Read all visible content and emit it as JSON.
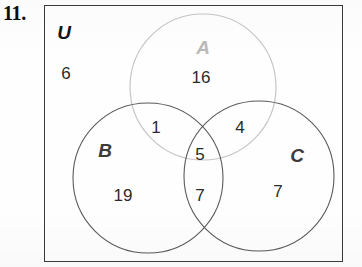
{
  "problem": {
    "number_label": "11."
  },
  "diagram": {
    "type": "venn-3-set",
    "universe_label": "U",
    "sets": [
      {
        "key": "A",
        "label": "A",
        "cx": 203,
        "cy": 87,
        "r": 73,
        "stroke": "#c6c6c6",
        "label_color": "#b9b9b9"
      },
      {
        "key": "B",
        "label": "B",
        "cx": 148,
        "cy": 178,
        "r": 75,
        "stroke": "#5a5a5a",
        "label_color": "#3c3c3c"
      },
      {
        "key": "C",
        "label": "C",
        "cx": 259,
        "cy": 176,
        "r": 75,
        "stroke": "#5a5a5a",
        "label_color": "#3c3c3c"
      }
    ],
    "regions": [
      {
        "key": "outside",
        "region": "U only (outside A, B, C)",
        "value": "6"
      },
      {
        "key": "a_only",
        "region": "A only",
        "value": "16"
      },
      {
        "key": "ab",
        "region": "A and B only",
        "value": "1"
      },
      {
        "key": "ac",
        "region": "A and C only",
        "value": "4"
      },
      {
        "key": "abc",
        "region": "A and B and C",
        "value": "5"
      },
      {
        "key": "bc",
        "region": "B and C only",
        "value": "7"
      },
      {
        "key": "b_only",
        "region": "B only",
        "value": "19"
      },
      {
        "key": "c_only",
        "region": "C only",
        "value": "7"
      }
    ],
    "colors": {
      "rect_border": "#3a3a3a",
      "circle_a_stroke": "#c6c6c6",
      "circle_bc_stroke": "#5a5a5a",
      "number_text": "#2b2b2b",
      "background": "#fefefe"
    }
  },
  "chart_data": {
    "type": "diagram",
    "title": "",
    "categories": [
      "U only",
      "A only",
      "A∩B only",
      "A∩C only",
      "A∩B∩C",
      "B∩C only",
      "B only",
      "C only"
    ],
    "values": [
      6,
      16,
      1,
      4,
      5,
      7,
      19,
      7
    ],
    "legend": [
      "U",
      "A",
      "B",
      "C"
    ]
  }
}
